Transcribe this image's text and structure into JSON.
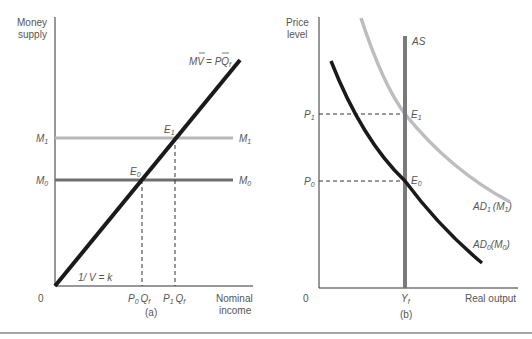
{
  "panel_a": {
    "y_axis_label": [
      "Money",
      "supply"
    ],
    "x_axis_label": [
      "Nominal",
      "income"
    ],
    "origin": "0",
    "caption": "(a)",
    "line_label": "MV̄ = PQ̄f",
    "line_label_parts": {
      "m": "M",
      "v": "V",
      "eq": "= P",
      "q": "Q",
      "sub": "f"
    },
    "slope_label": "1/ V = k",
    "levels": [
      {
        "name": "M",
        "sub": "1",
        "color": "#b8b8b8"
      },
      {
        "name": "M",
        "sub": "0",
        "color": "#6f6f6f"
      }
    ],
    "equilibria": [
      {
        "name": "E",
        "sub": "0"
      },
      {
        "name": "E",
        "sub": "1"
      }
    ],
    "x_ticks": [
      {
        "p": "P",
        "psub": "0",
        "q": "Q",
        "qsub": "f"
      },
      {
        "p": "P",
        "psub": "1",
        "q": "Q",
        "qsub": "f"
      }
    ]
  },
  "panel_b": {
    "y_axis_label": [
      "Price",
      "level"
    ],
    "x_axis_label": "Real output",
    "origin": "0",
    "caption": "(b)",
    "as_label": "AS",
    "y_ticks": [
      {
        "name": "P",
        "sub": "1"
      },
      {
        "name": "P",
        "sub": "0"
      }
    ],
    "x_tick": {
      "name": "Y",
      "sub": "f"
    },
    "equilibria": [
      {
        "name": "E",
        "sub": "1"
      },
      {
        "name": "E",
        "sub": "0"
      }
    ],
    "curves": [
      {
        "name": "AD",
        "sub": "1",
        "arg": "M",
        "argsub": "1",
        "color": "#bdbdbd"
      },
      {
        "name": "AD",
        "sub": "0",
        "arg": "M",
        "argsub": "0",
        "color": "#1a1a1a"
      }
    ],
    "as_color": "#7a7a7a"
  }
}
